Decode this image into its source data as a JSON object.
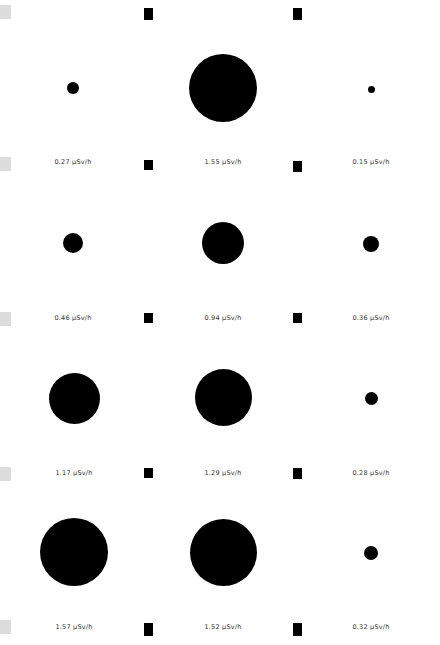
{
  "unit": "µSv/h",
  "chart_data": {
    "type": "scatter",
    "title": "",
    "xlabel": "",
    "ylabel": "",
    "grid": false,
    "layout": "3 columns x 4 rows of circles; circle size proportional to dose rate",
    "series": [
      {
        "name": "dose_rate_uSv_per_h",
        "values": [
          [
            0.27,
            1.55,
            0.15
          ],
          [
            0.46,
            0.94,
            0.36
          ],
          [
            1.17,
            1.29,
            0.28
          ],
          [
            1.57,
            1.52,
            0.32
          ]
        ]
      }
    ],
    "labels": [
      [
        "0.27 µSv/h",
        "1.55 µSv/h",
        "0.15 µSv/h"
      ],
      [
        "0.46 µSv/h",
        "0.94 µSv/h",
        "0.36 µSv/h"
      ],
      [
        "1.17 µSv/h",
        "1.29 µSv/h",
        "0.28 µSv/h"
      ],
      [
        "1.57 µSv/h",
        "1.52 µSv/h",
        "0.32 µSv/h"
      ]
    ]
  },
  "cells": [
    {
      "label": "0.27 µSv/h",
      "cx": 73,
      "cy": 88,
      "d": 12
    },
    {
      "label": "1.55 µSv/h",
      "cx": 223,
      "cy": 88,
      "d": 68
    },
    {
      "label": "0.15 µSv/h",
      "cx": 371,
      "cy": 89,
      "d": 7
    },
    {
      "label": "0.46 µSv/h",
      "cx": 73,
      "cy": 243,
      "d": 20
    },
    {
      "label": "0.94 µSv/h",
      "cx": 223,
      "cy": 243,
      "d": 42
    },
    {
      "label": "0.36 µSv/h",
      "cx": 371,
      "cy": 244,
      "d": 16
    },
    {
      "label": "1.17 µSv/h",
      "cx": 74,
      "cy": 398,
      "d": 51
    },
    {
      "label": "1.29 µSv/h",
      "cx": 223,
      "cy": 397,
      "d": 57
    },
    {
      "label": "0.28 µSv/h",
      "cx": 371,
      "cy": 398,
      "d": 13
    },
    {
      "label": "1.57 µSv/h",
      "cx": 74,
      "cy": 552,
      "d": 68
    },
    {
      "label": "1.52 µSv/h",
      "cx": 223,
      "cy": 552,
      "d": 67
    },
    {
      "label": "0.32 µSv/h",
      "cx": 371,
      "cy": 553,
      "d": 14
    }
  ]
}
